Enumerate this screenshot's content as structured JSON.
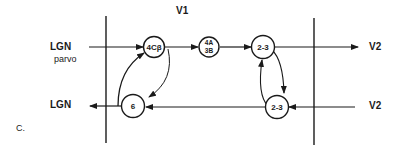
{
  "diagram": {
    "panel_label": "C.",
    "region_top_label": "V1",
    "inputs": {
      "lgn_in": "LGN",
      "lgn_in_sub": "parvo",
      "lgn_out": "LGN",
      "v2_out": "V2",
      "v2_in": "V2"
    },
    "nodes": [
      {
        "id": "n4cb",
        "label": "4Cβ"
      },
      {
        "id": "n4a3b",
        "label_top": "4A",
        "label_bottom": "3B"
      },
      {
        "id": "n23top",
        "label": "2-3"
      },
      {
        "id": "n6",
        "label": "6"
      },
      {
        "id": "n23bot",
        "label": "2-3"
      }
    ],
    "colors": {
      "stroke": "#1a1a1a",
      "background": "#ffffff"
    }
  }
}
